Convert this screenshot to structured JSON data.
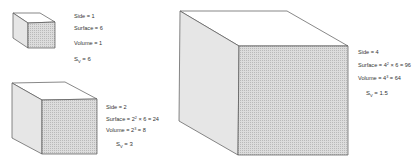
{
  "colors": {
    "edge": "#555555",
    "top_face": "#ffffff",
    "side_face": "#e4e4e4",
    "front_face": "#d6d6d6",
    "hatch": "#b8b8b8",
    "text": "#333333"
  },
  "cubes": [
    {
      "id": "small",
      "side": "Side = 1",
      "surface": "Surface = 6",
      "volume": "Volume = 1",
      "sv_prefix": "S",
      "sv_sub": "V",
      "sv_value": "= 6"
    },
    {
      "id": "medium",
      "side": "Side = 2",
      "surface_a": "Surface = 2",
      "surface_exp": "2",
      "surface_b": " × 6 = 24",
      "volume_a": "Volume = 2",
      "volume_exp": "3",
      "volume_b": " = 8",
      "sv_prefix": "S",
      "sv_sub": "V",
      "sv_value": "= 3"
    },
    {
      "id": "large",
      "side": "Side = 4",
      "surface_a": "Surface = 4",
      "surface_exp": "2",
      "surface_b": " × 6 = 96",
      "volume_a": "Volume = 4",
      "volume_exp": "3",
      "volume_b": " = 64",
      "sv_prefix": "S",
      "sv_sub": "V",
      "sv_value": "= 1.5"
    }
  ]
}
